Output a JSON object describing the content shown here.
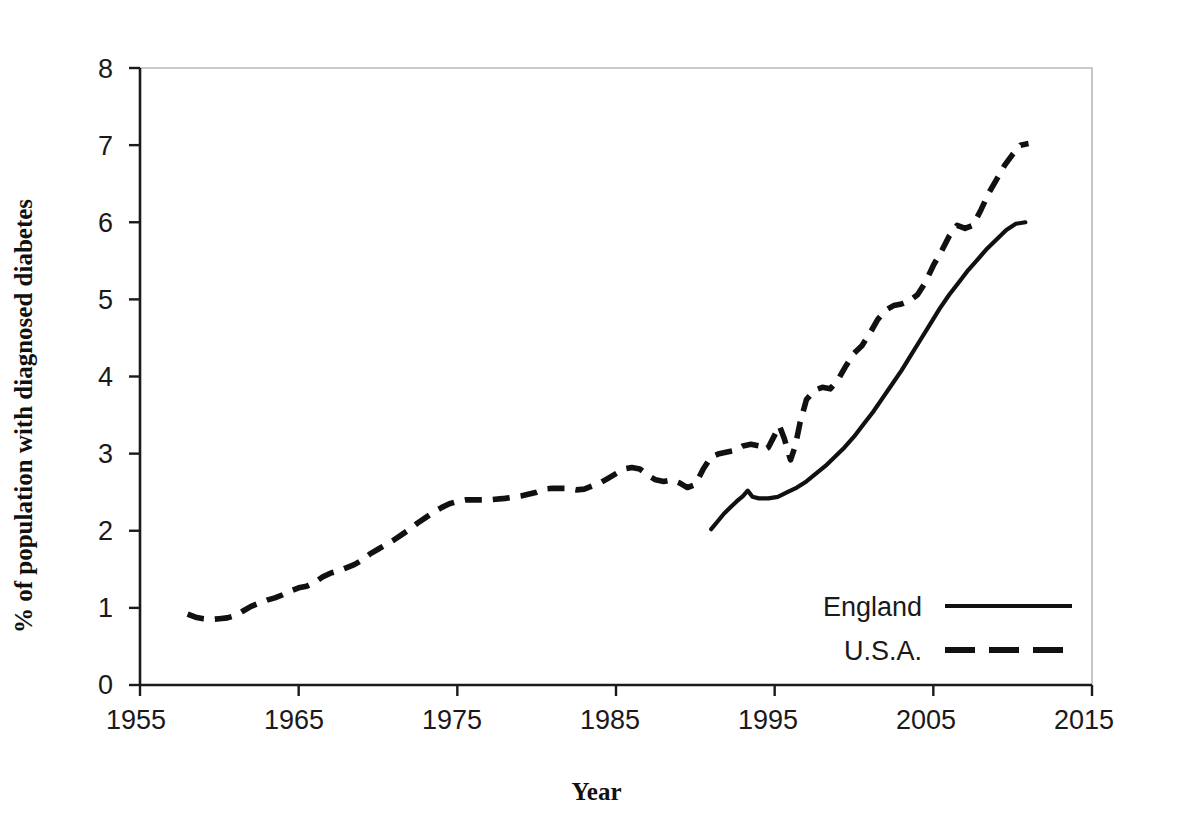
{
  "chart_data": {
    "type": "line",
    "title": "",
    "xlabel": "Year",
    "ylabel": "% of population with diagnosed diabetes",
    "xlim": [
      1955,
      2015
    ],
    "ylim": [
      0,
      8
    ],
    "xticks": [
      "1955",
      "1965",
      "1975",
      "1985",
      "1995",
      "2005",
      "2015"
    ],
    "yticks": [
      "0",
      "1",
      "2",
      "3",
      "4",
      "5",
      "6",
      "7",
      "8"
    ],
    "grid": false,
    "legend_position": "bottom-right",
    "series": [
      {
        "name": "England",
        "style": "solid",
        "color": "#111111",
        "points": [
          [
            1991.0,
            2.02
          ],
          [
            1991.4,
            2.12
          ],
          [
            1991.8,
            2.22
          ],
          [
            1992.2,
            2.3
          ],
          [
            1992.6,
            2.38
          ],
          [
            1993.0,
            2.45
          ],
          [
            1993.3,
            2.52
          ],
          [
            1993.6,
            2.44
          ],
          [
            1994.0,
            2.42
          ],
          [
            1994.6,
            2.42
          ],
          [
            1995.2,
            2.44
          ],
          [
            1995.8,
            2.5
          ],
          [
            1996.4,
            2.56
          ],
          [
            1997.0,
            2.64
          ],
          [
            1997.6,
            2.74
          ],
          [
            1998.2,
            2.84
          ],
          [
            1998.8,
            2.96
          ],
          [
            1999.4,
            3.08
          ],
          [
            2000.0,
            3.22
          ],
          [
            2000.6,
            3.38
          ],
          [
            2001.2,
            3.54
          ],
          [
            2001.8,
            3.72
          ],
          [
            2002.4,
            3.9
          ],
          [
            2003.0,
            4.08
          ],
          [
            2003.6,
            4.28
          ],
          [
            2004.2,
            4.48
          ],
          [
            2004.8,
            4.68
          ],
          [
            2005.4,
            4.88
          ],
          [
            2006.0,
            5.06
          ],
          [
            2006.6,
            5.22
          ],
          [
            2007.2,
            5.38
          ],
          [
            2007.8,
            5.52
          ],
          [
            2008.4,
            5.66
          ],
          [
            2009.0,
            5.78
          ],
          [
            2009.6,
            5.9
          ],
          [
            2010.2,
            5.98
          ],
          [
            2010.8,
            6.0
          ]
        ]
      },
      {
        "name": "U.S.A.",
        "style": "dashed",
        "color": "#111111",
        "points": [
          [
            1958.0,
            0.92
          ],
          [
            1958.5,
            0.88
          ],
          [
            1959.0,
            0.86
          ],
          [
            1959.5,
            0.85
          ],
          [
            1960.0,
            0.86
          ],
          [
            1960.5,
            0.87
          ],
          [
            1961.0,
            0.9
          ],
          [
            1961.5,
            0.96
          ],
          [
            1962.0,
            1.02
          ],
          [
            1962.5,
            1.06
          ],
          [
            1963.0,
            1.1
          ],
          [
            1963.5,
            1.13
          ],
          [
            1964.0,
            1.17
          ],
          [
            1964.5,
            1.22
          ],
          [
            1965.0,
            1.26
          ],
          [
            1965.5,
            1.28
          ],
          [
            1966.0,
            1.33
          ],
          [
            1966.5,
            1.4
          ],
          [
            1967.0,
            1.45
          ],
          [
            1967.5,
            1.48
          ],
          [
            1968.0,
            1.52
          ],
          [
            1968.5,
            1.56
          ],
          [
            1969.0,
            1.62
          ],
          [
            1969.5,
            1.7
          ],
          [
            1970.0,
            1.76
          ],
          [
            1970.5,
            1.82
          ],
          [
            1971.0,
            1.88
          ],
          [
            1971.5,
            1.95
          ],
          [
            1972.0,
            2.02
          ],
          [
            1972.5,
            2.1
          ],
          [
            1973.0,
            2.17
          ],
          [
            1973.5,
            2.24
          ],
          [
            1974.0,
            2.3
          ],
          [
            1974.5,
            2.35
          ],
          [
            1975.0,
            2.38
          ],
          [
            1975.5,
            2.4
          ],
          [
            1976.0,
            2.4
          ],
          [
            1977.0,
            2.4
          ],
          [
            1978.0,
            2.42
          ],
          [
            1979.0,
            2.45
          ],
          [
            1980.0,
            2.5
          ],
          [
            1980.5,
            2.54
          ],
          [
            1981.0,
            2.55
          ],
          [
            1982.0,
            2.55
          ],
          [
            1982.5,
            2.53
          ],
          [
            1983.0,
            2.54
          ],
          [
            1983.5,
            2.58
          ],
          [
            1984.0,
            2.62
          ],
          [
            1984.5,
            2.68
          ],
          [
            1985.0,
            2.74
          ],
          [
            1985.5,
            2.8
          ],
          [
            1986.0,
            2.82
          ],
          [
            1986.5,
            2.8
          ],
          [
            1987.0,
            2.72
          ],
          [
            1987.5,
            2.66
          ],
          [
            1988.0,
            2.64
          ],
          [
            1988.5,
            2.66
          ],
          [
            1989.0,
            2.62
          ],
          [
            1989.5,
            2.56
          ],
          [
            1990.0,
            2.6
          ],
          [
            1990.5,
            2.8
          ],
          [
            1991.0,
            2.96
          ],
          [
            1991.5,
            3.0
          ],
          [
            1992.0,
            3.02
          ],
          [
            1992.5,
            3.04
          ],
          [
            1993.0,
            3.1
          ],
          [
            1993.5,
            3.12
          ],
          [
            1994.0,
            3.1
          ],
          [
            1994.3,
            3.04
          ],
          [
            1994.6,
            3.08
          ],
          [
            1995.0,
            3.24
          ],
          [
            1995.3,
            3.36
          ],
          [
            1995.6,
            3.2
          ],
          [
            1996.0,
            2.92
          ],
          [
            1996.3,
            3.1
          ],
          [
            1996.6,
            3.4
          ],
          [
            1997.0,
            3.7
          ],
          [
            1997.5,
            3.82
          ],
          [
            1998.0,
            3.86
          ],
          [
            1998.5,
            3.84
          ],
          [
            1999.0,
            3.96
          ],
          [
            1999.5,
            4.14
          ],
          [
            2000.0,
            4.3
          ],
          [
            2000.5,
            4.4
          ],
          [
            2001.0,
            4.56
          ],
          [
            2001.5,
            4.74
          ],
          [
            2002.0,
            4.86
          ],
          [
            2002.5,
            4.92
          ],
          [
            2003.0,
            4.94
          ],
          [
            2003.5,
            4.98
          ],
          [
            2004.0,
            5.06
          ],
          [
            2004.5,
            5.22
          ],
          [
            2005.0,
            5.44
          ],
          [
            2005.5,
            5.62
          ],
          [
            2006.0,
            5.82
          ],
          [
            2006.5,
            5.96
          ],
          [
            2007.0,
            5.92
          ],
          [
            2007.5,
            5.96
          ],
          [
            2008.0,
            6.16
          ],
          [
            2008.5,
            6.38
          ],
          [
            2009.0,
            6.56
          ],
          [
            2009.5,
            6.74
          ],
          [
            2010.0,
            6.88
          ],
          [
            2010.5,
            7.0
          ],
          [
            2011.0,
            7.02
          ]
        ]
      }
    ]
  },
  "legend": {
    "entries": [
      {
        "label": "England",
        "style": "solid"
      },
      {
        "label": "U.S.A.",
        "style": "dashed"
      }
    ]
  },
  "axes": {
    "x_title": "Year",
    "y_title": "% of population with diagnosed diabetes"
  }
}
